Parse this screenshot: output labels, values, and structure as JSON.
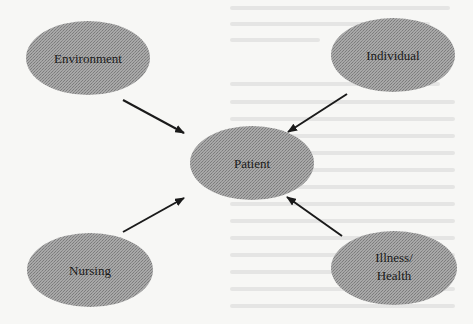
{
  "diagram": {
    "type": "concept-map",
    "center_node": {
      "id": "patient",
      "label": "Patient"
    },
    "nodes": [
      {
        "id": "environment",
        "label": "Environment"
      },
      {
        "id": "individual",
        "label": "Individual"
      },
      {
        "id": "nursing",
        "label": "Nursing"
      },
      {
        "id": "illness-health",
        "label_line1": "Illness/",
        "label_line2": "Health"
      }
    ],
    "edges": [
      {
        "from": "environment",
        "to": "patient"
      },
      {
        "from": "individual",
        "to": "patient"
      },
      {
        "from": "nursing",
        "to": "patient"
      },
      {
        "from": "illness-health",
        "to": "patient"
      }
    ],
    "colors": {
      "node_fill": "#9a9a9a",
      "arrow": "#1a1a1a",
      "background": "#f7f7f5",
      "text": "#1a1a1a"
    }
  }
}
